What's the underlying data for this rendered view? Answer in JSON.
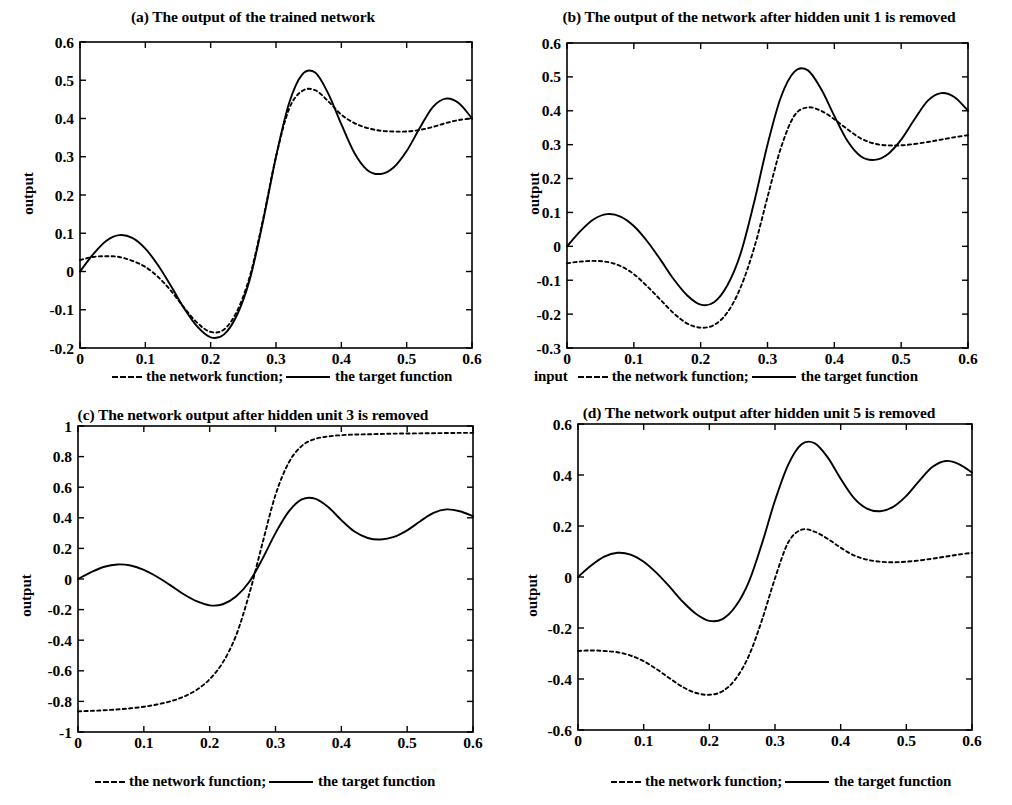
{
  "figure": {
    "background": "#ffffff",
    "ink": "#000000",
    "panel_count": 4
  },
  "legend_text": {
    "dash_label": "the network function;",
    "solid_label": "the target function",
    "input_label": "input"
  },
  "panels": [
    {
      "id": "a",
      "title": "(a) The output of the trained network",
      "ylabel": "output",
      "show_input_label": false,
      "chart_data": {
        "type": "line",
        "title": "(a) The output of the trained network",
        "xlabel": "",
        "ylabel": "output",
        "xlim": [
          0,
          0.6
        ],
        "ylim": [
          -0.2,
          0.6
        ],
        "xticks": [
          "0",
          "0.1",
          "0.2",
          "0.3",
          "0.4",
          "0.5",
          "0.6"
        ],
        "yticks": [
          "-0.2",
          "-0.1",
          "0",
          "0.1",
          "0.2",
          "0.3",
          "0.4",
          "0.5",
          "0.6"
        ],
        "grid": false,
        "legend_position": "below-axes",
        "x": [
          0,
          0.02,
          0.04,
          0.06,
          0.08,
          0.1,
          0.12,
          0.14,
          0.16,
          0.18,
          0.2,
          0.22,
          0.24,
          0.26,
          0.28,
          0.3,
          0.32,
          0.34,
          0.36,
          0.38,
          0.4,
          0.42,
          0.44,
          0.46,
          0.48,
          0.5,
          0.52,
          0.54,
          0.56,
          0.58,
          0.6
        ],
        "series": [
          {
            "name": "the target function",
            "style": "solid",
            "values": [
              0.0,
              0.045,
              0.08,
              0.095,
              0.088,
              0.06,
              0.015,
              -0.04,
              -0.098,
              -0.145,
              -0.172,
              -0.165,
              -0.115,
              -0.02,
              0.13,
              0.3,
              0.44,
              0.515,
              0.52,
              0.465,
              0.385,
              0.31,
              0.265,
              0.255,
              0.272,
              0.315,
              0.375,
              0.43,
              0.452,
              0.44,
              0.4
            ]
          },
          {
            "name": "the network function",
            "style": "dashed",
            "values": [
              0.03,
              0.038,
              0.04,
              0.038,
              0.028,
              0.012,
              -0.015,
              -0.052,
              -0.096,
              -0.135,
              -0.158,
              -0.152,
              -0.105,
              -0.012,
              0.135,
              0.3,
              0.425,
              0.472,
              0.474,
              0.445,
              0.41,
              0.388,
              0.375,
              0.368,
              0.366,
              0.366,
              0.37,
              0.378,
              0.388,
              0.396,
              0.4
            ]
          }
        ]
      }
    },
    {
      "id": "b",
      "title": "(b) The output of the  network after hidden unit 1 is removed",
      "ylabel": "output",
      "show_input_label": true,
      "chart_data": {
        "type": "line",
        "title": "(b) The output of the  network after hidden unit 1 is removed",
        "xlabel": "input",
        "ylabel": "output",
        "xlim": [
          0,
          0.6
        ],
        "ylim": [
          -0.3,
          0.6
        ],
        "xticks": [
          "0",
          "0.1",
          "0.2",
          "0.3",
          "0.4",
          "0.5",
          "0.6"
        ],
        "yticks": [
          "-0.3",
          "-0.2",
          "-0.1",
          "0",
          "0.1",
          "0.2",
          "0.3",
          "0.4",
          "0.5",
          "0.6"
        ],
        "grid": false,
        "legend_position": "below-axes",
        "x": [
          0,
          0.02,
          0.04,
          0.06,
          0.08,
          0.1,
          0.12,
          0.14,
          0.16,
          0.18,
          0.2,
          0.22,
          0.24,
          0.26,
          0.28,
          0.3,
          0.32,
          0.34,
          0.36,
          0.38,
          0.4,
          0.42,
          0.44,
          0.46,
          0.48,
          0.5,
          0.52,
          0.54,
          0.56,
          0.58,
          0.6
        ],
        "series": [
          {
            "name": "the target function",
            "style": "solid",
            "values": [
              0.0,
              0.045,
              0.08,
              0.095,
              0.088,
              0.06,
              0.015,
              -0.04,
              -0.098,
              -0.145,
              -0.172,
              -0.165,
              -0.115,
              -0.02,
              0.13,
              0.3,
              0.44,
              0.515,
              0.52,
              0.465,
              0.385,
              0.31,
              0.265,
              0.255,
              0.272,
              0.315,
              0.375,
              0.43,
              0.452,
              0.44,
              0.4
            ]
          },
          {
            "name": "the network function",
            "style": "dashed",
            "values": [
              -0.05,
              -0.045,
              -0.043,
              -0.046,
              -0.058,
              -0.082,
              -0.118,
              -0.158,
              -0.198,
              -0.228,
              -0.24,
              -0.232,
              -0.195,
              -0.12,
              -0.005,
              0.145,
              0.29,
              0.385,
              0.41,
              0.4,
              0.375,
              0.345,
              0.318,
              0.303,
              0.298,
              0.298,
              0.302,
              0.308,
              0.315,
              0.322,
              0.328
            ]
          }
        ]
      }
    },
    {
      "id": "c",
      "title": "(c) The network output after hidden unit 3 is removed",
      "ylabel": "output",
      "show_input_label": false,
      "chart_data": {
        "type": "line",
        "title": "(c) The network output after hidden unit 3 is removed",
        "xlabel": "",
        "ylabel": "output",
        "xlim": [
          0,
          0.6
        ],
        "ylim": [
          -1,
          1
        ],
        "xticks": [
          "0",
          "0.1",
          "0.2",
          "0.3",
          "0.4",
          "0.5",
          "0.6"
        ],
        "yticks": [
          "-1",
          "-0.8",
          "-0.6",
          "-0.4",
          "-0.2",
          "0",
          "0.2",
          "0.4",
          "0.6",
          "0.8",
          "1"
        ],
        "grid": false,
        "legend_position": "below-axes",
        "x": [
          0,
          0.02,
          0.04,
          0.06,
          0.08,
          0.1,
          0.12,
          0.14,
          0.16,
          0.18,
          0.2,
          0.22,
          0.24,
          0.26,
          0.28,
          0.3,
          0.32,
          0.34,
          0.36,
          0.38,
          0.4,
          0.42,
          0.44,
          0.46,
          0.48,
          0.5,
          0.52,
          0.54,
          0.56,
          0.58,
          0.6
        ],
        "series": [
          {
            "name": "the target function",
            "style": "solid",
            "values": [
              0.0,
              0.045,
              0.08,
              0.095,
              0.088,
              0.06,
              0.015,
              -0.04,
              -0.098,
              -0.145,
              -0.172,
              -0.165,
              -0.115,
              -0.02,
              0.13,
              0.3,
              0.44,
              0.52,
              0.525,
              0.47,
              0.385,
              0.31,
              0.268,
              0.258,
              0.275,
              0.318,
              0.378,
              0.432,
              0.455,
              0.443,
              0.41
            ]
          },
          {
            "name": "the network function",
            "style": "dashed",
            "values": [
              -0.865,
              -0.862,
              -0.858,
              -0.852,
              -0.845,
              -0.835,
              -0.82,
              -0.8,
              -0.77,
              -0.725,
              -0.655,
              -0.545,
              -0.37,
              -0.1,
              0.23,
              0.55,
              0.76,
              0.87,
              0.915,
              0.932,
              0.94,
              0.944,
              0.946,
              0.948,
              0.95,
              0.951,
              0.952,
              0.953,
              0.954,
              0.955,
              0.955
            ]
          }
        ]
      }
    },
    {
      "id": "d",
      "title": "(d) The network output after hidden unit 5 is removed",
      "ylabel": "output",
      "show_input_label": false,
      "chart_data": {
        "type": "line",
        "title": "(d) The network output after hidden unit 5 is removed",
        "xlabel": "",
        "ylabel": "output",
        "xlim": [
          0,
          0.6
        ],
        "ylim": [
          -0.6,
          0.6
        ],
        "xticks": [
          "0",
          "0.1",
          "0.2",
          "0.3",
          "0.4",
          "0.5",
          "0.6"
        ],
        "yticks": [
          "-0.6",
          "-0.4",
          "-0.2",
          "0",
          "0.2",
          "0.4",
          "0.6"
        ],
        "grid": false,
        "legend_position": "below-axes",
        "x": [
          0,
          0.02,
          0.04,
          0.06,
          0.08,
          0.1,
          0.12,
          0.14,
          0.16,
          0.18,
          0.2,
          0.22,
          0.24,
          0.26,
          0.28,
          0.3,
          0.32,
          0.34,
          0.36,
          0.38,
          0.4,
          0.42,
          0.44,
          0.46,
          0.48,
          0.5,
          0.52,
          0.54,
          0.56,
          0.58,
          0.6
        ],
        "series": [
          {
            "name": "the target function",
            "style": "solid",
            "values": [
              0.0,
              0.045,
              0.08,
              0.095,
              0.088,
              0.06,
              0.015,
              -0.04,
              -0.098,
              -0.145,
              -0.172,
              -0.165,
              -0.115,
              -0.02,
              0.13,
              0.3,
              0.44,
              0.52,
              0.525,
              0.47,
              0.385,
              0.31,
              0.268,
              0.258,
              0.275,
              0.318,
              0.378,
              0.432,
              0.455,
              0.443,
              0.41
            ]
          },
          {
            "name": "the network function",
            "style": "dashed",
            "values": [
              -0.29,
              -0.288,
              -0.29,
              -0.295,
              -0.308,
              -0.33,
              -0.362,
              -0.398,
              -0.432,
              -0.455,
              -0.462,
              -0.448,
              -0.4,
              -0.31,
              -0.17,
              -0.005,
              0.135,
              0.185,
              0.178,
              0.15,
              0.115,
              0.085,
              0.068,
              0.06,
              0.058,
              0.06,
              0.065,
              0.072,
              0.08,
              0.088,
              0.095
            ]
          }
        ]
      }
    }
  ]
}
